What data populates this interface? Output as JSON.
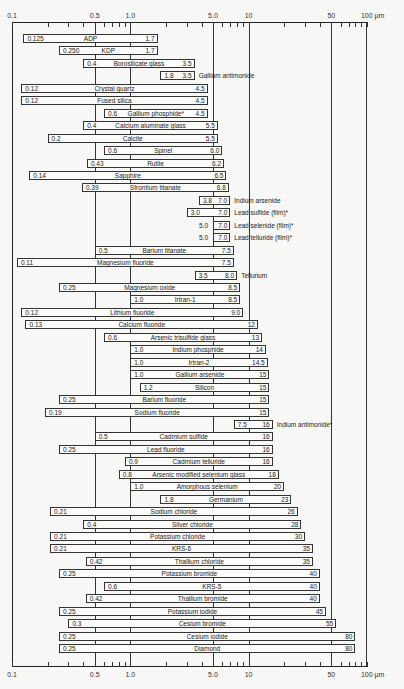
{
  "chart_data": {
    "type": "bar",
    "subtype": "range-bar (floating horizontal bars on log scale)",
    "title": "",
    "xlabel": "Wavelength (µm)",
    "ylabel": "",
    "xscale": "log",
    "xlim": [
      0.1,
      100
    ],
    "unit": "µm",
    "x_ticks_major": [
      {
        "value": 0.1,
        "label": "0.1"
      },
      {
        "value": 0.5,
        "label": "0.5"
      },
      {
        "value": 1.0,
        "label": "1.0"
      },
      {
        "value": 5.0,
        "label": "5.0"
      },
      {
        "value": 10,
        "label": "10"
      },
      {
        "value": 50,
        "label": "50"
      },
      {
        "value": 100,
        "label": "100 µm"
      }
    ],
    "x_ticks_minor": [
      0.2,
      0.3,
      0.4,
      0.6,
      0.7,
      0.8,
      0.9,
      2,
      3,
      4,
      6,
      7,
      8,
      9,
      20,
      30,
      40,
      60,
      70,
      80,
      90
    ],
    "gridlines_at": [
      0.5,
      1.0,
      5.0,
      10,
      50
    ],
    "grid": true,
    "legend": "none",
    "annotations": [
      "* film / marked materials"
    ],
    "series": [
      {
        "name": "ADP",
        "low": 0.125,
        "high": 1.7,
        "low_label": "0.125",
        "high_label": "1.7",
        "label_inside": true
      },
      {
        "name": "KDP",
        "low": 0.25,
        "high": 1.7,
        "low_label": "0.250",
        "high_label": "1.7",
        "label_inside": true
      },
      {
        "name": "Borosilicate glass",
        "low": 0.4,
        "high": 3.5,
        "low_label": "0.4",
        "high_label": "3.5",
        "label_inside": true
      },
      {
        "name": "Gallium antimonide",
        "low": 1.8,
        "high": 3.5,
        "low_label": "1.8",
        "high_label": "3.5",
        "label_inside": false
      },
      {
        "name": "Crystal quartz",
        "low": 0.12,
        "high": 4.5,
        "low_label": "0.12",
        "high_label": "4.5",
        "label_inside": true
      },
      {
        "name": "Fused silica",
        "low": 0.12,
        "high": 4.5,
        "low_label": "0.12",
        "high_label": "4.5",
        "label_inside": true
      },
      {
        "name": "Gallium phosphide*",
        "low": 0.6,
        "high": 4.5,
        "low_label": "0.6",
        "high_label": "4.5",
        "label_inside": true
      },
      {
        "name": "Calcium aluminate glass",
        "low": 0.4,
        "high": 5.5,
        "low_label": "0.4",
        "high_label": "5.5",
        "label_inside": true
      },
      {
        "name": "Calcite",
        "low": 0.2,
        "high": 5.5,
        "low_label": "0.2",
        "high_label": "5.5",
        "label_inside": true
      },
      {
        "name": "Spinel",
        "low": 0.6,
        "high": 6.0,
        "low_label": "0.6",
        "high_label": "6.0",
        "label_inside": true
      },
      {
        "name": "Rutile",
        "low": 0.43,
        "high": 6.2,
        "low_label": "0.43",
        "high_label": "6.2",
        "label_inside": true
      },
      {
        "name": "Sapphire",
        "low": 0.14,
        "high": 6.5,
        "low_label": "0.14",
        "high_label": "6.5",
        "label_inside": true
      },
      {
        "name": "Strontium titanate",
        "low": 0.39,
        "high": 6.8,
        "low_label": "0.39",
        "high_label": "6.8",
        "label_inside": true
      },
      {
        "name": "Indium arsenide",
        "low": 3.8,
        "high": 7.0,
        "low_label": "3.8",
        "high_label": "7.0",
        "label_inside": false
      },
      {
        "name": "Lead sulfide (film)*",
        "low": 3.0,
        "high": 7.0,
        "low_label": "3.0",
        "high_label": "7.0",
        "label_inside": false
      },
      {
        "name": "Lead selenide (film)*",
        "low": 5.0,
        "high": 7.0,
        "low_label": "5.0",
        "high_label": "7.0",
        "label_inside": false,
        "low_outside": true
      },
      {
        "name": "Lead telluride (film)*",
        "low": 5.0,
        "high": 7.0,
        "low_label": "5.0",
        "high_label": "7.0",
        "label_inside": false,
        "low_outside": true
      },
      {
        "name": "Barium titanate",
        "low": 0.5,
        "high": 7.5,
        "low_label": "0.5",
        "high_label": "7.5",
        "label_inside": true
      },
      {
        "name": "Magnesium fluoride",
        "low": 0.11,
        "high": 7.5,
        "low_label": "0.11",
        "high_label": "7.5",
        "label_inside": true
      },
      {
        "name": "Tellurium",
        "low": 3.5,
        "high": 8.0,
        "low_label": "3.5",
        "high_label": "8.0",
        "label_inside": false
      },
      {
        "name": "Magnesium oxide",
        "low": 0.25,
        "high": 8.5,
        "low_label": "0.25",
        "high_label": "8.5",
        "label_inside": true
      },
      {
        "name": "Irtran-1",
        "low": 1.0,
        "high": 8.5,
        "low_label": "1.0",
        "high_label": "8.5",
        "label_inside": true
      },
      {
        "name": "Lithium fluoride",
        "low": 0.12,
        "high": 9.0,
        "low_label": "0.12",
        "high_label": "9.0",
        "label_inside": true
      },
      {
        "name": "Calcium fluoride",
        "low": 0.13,
        "high": 12,
        "low_label": "0.13",
        "high_label": "12",
        "label_inside": true
      },
      {
        "name": "Arsenic trisulfide glass",
        "low": 0.6,
        "high": 13,
        "low_label": "0.6",
        "high_label": "13",
        "label_inside": true
      },
      {
        "name": "Indium phosphide",
        "low": 1.0,
        "high": 14,
        "low_label": "1.0",
        "high_label": "14",
        "label_inside": true
      },
      {
        "name": "Irtran-2",
        "low": 1.0,
        "high": 14.5,
        "low_label": "1.0",
        "high_label": "14.5",
        "label_inside": true
      },
      {
        "name": "Gallium arsenide",
        "low": 1.0,
        "high": 15,
        "low_label": "1.0",
        "high_label": "15",
        "label_inside": true
      },
      {
        "name": "Silicon",
        "low": 1.2,
        "high": 15,
        "low_label": "1.2",
        "high_label": "15",
        "label_inside": true
      },
      {
        "name": "Barium fluoride",
        "low": 0.25,
        "high": 15,
        "low_label": "0.25",
        "high_label": "15",
        "label_inside": true
      },
      {
        "name": "Sodium fluoride",
        "low": 0.19,
        "high": 15,
        "low_label": "0.19",
        "high_label": "15",
        "label_inside": true
      },
      {
        "name": "Indium antimonide*",
        "low": 7.5,
        "high": 16,
        "low_label": "7.5",
        "high_label": "16",
        "label_inside": false
      },
      {
        "name": "Cadmium sulfide",
        "low": 0.5,
        "high": 16,
        "low_label": "0.5",
        "high_label": "16",
        "label_inside": true
      },
      {
        "name": "Lead fluoride",
        "low": 0.25,
        "high": 16,
        "low_label": "0.25",
        "high_label": "16",
        "label_inside": true
      },
      {
        "name": "Cadmium telluride",
        "low": 0.9,
        "high": 16,
        "low_label": "0.9",
        "high_label": "16",
        "label_inside": true
      },
      {
        "name": "Arsenic modified selenium glass",
        "low": 0.8,
        "high": 18,
        "low_label": "0.8",
        "high_label": "18",
        "label_inside": true
      },
      {
        "name": "Amorphous selenium",
        "low": 1.0,
        "high": 20,
        "low_label": "1.0",
        "high_label": "20",
        "label_inside": true
      },
      {
        "name": "Germanium",
        "low": 1.8,
        "high": 23,
        "low_label": "1.8",
        "high_label": "23",
        "label_inside": true
      },
      {
        "name": "Sodium chloride",
        "low": 0.21,
        "high": 26,
        "low_label": "0.21",
        "high_label": "26",
        "label_inside": true
      },
      {
        "name": "Silver chloride",
        "low": 0.4,
        "high": 28,
        "low_label": "0.4",
        "high_label": "28",
        "label_inside": true
      },
      {
        "name": "Potassium chloride",
        "low": 0.21,
        "high": 30,
        "low_label": "0.21",
        "high_label": "30",
        "label_inside": true
      },
      {
        "name": "KRS-6",
        "low": 0.21,
        "high": 35,
        "low_label": "0.21",
        "high_label": "35",
        "label_inside": true
      },
      {
        "name": "Thallium chloride",
        "low": 0.42,
        "high": 35,
        "low_label": "0.42",
        "high_label": "35",
        "label_inside": true
      },
      {
        "name": "Potassium bromide",
        "low": 0.25,
        "high": 40,
        "low_label": "0.25",
        "high_label": "40",
        "label_inside": true
      },
      {
        "name": "KRS-5",
        "low": 0.6,
        "high": 40,
        "low_label": "0.6",
        "high_label": "40",
        "label_inside": true
      },
      {
        "name": "Thallium bromide",
        "low": 0.42,
        "high": 40,
        "low_label": "0.42",
        "high_label": "40",
        "label_inside": true
      },
      {
        "name": "Potassium iodide",
        "low": 0.25,
        "high": 45,
        "low_label": "0.25",
        "high_label": "45",
        "label_inside": true
      },
      {
        "name": "Cesium bromide",
        "low": 0.3,
        "high": 55,
        "low_label": "0.3",
        "high_label": "55",
        "label_inside": true
      },
      {
        "name": "Cesium iodide",
        "low": 0.25,
        "high": 80,
        "low_label": "0.25",
        "high_label": "80",
        "label_inside": true
      },
      {
        "name": "Diamond",
        "low": 0.25,
        "high": 80,
        "low_label": "0.25",
        "high_label": "80",
        "label_inside": true
      }
    ]
  },
  "layout": {
    "x0_px": 12,
    "decade_px": 118.3,
    "first_row_top": 34,
    "row_pitch": 12.45,
    "bar_height": 9
  }
}
